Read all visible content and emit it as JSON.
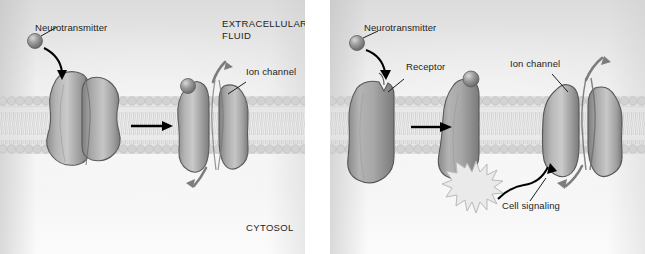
{
  "figure": {
    "panels": [
      {
        "id": "direct-gating",
        "labels": {
          "neurotransmitter": "Neurotransmitter",
          "extracellular": "EXTRACELLULAR\nFLUID",
          "ion_channel": "Ion channel",
          "cytosol": "CYTOSOL"
        },
        "structures": [
          {
            "name": "closed-ion-channel",
            "state": "closed"
          },
          {
            "name": "open-ion-channel",
            "state": "open"
          }
        ]
      },
      {
        "id": "indirect-gating",
        "labels": {
          "neurotransmitter": "Neurotransmitter",
          "receptor": "Receptor",
          "ion_channel": "Ion channel",
          "cell_signaling": "Cell signaling"
        },
        "structures": [
          {
            "name": "unbound-receptor",
            "state": "unbound"
          },
          {
            "name": "bound-receptor",
            "state": "bound"
          },
          {
            "name": "open-ion-channel",
            "state": "open"
          }
        ]
      }
    ]
  },
  "colors": {
    "protein_fill": "#9a9a9a",
    "protein_light": "#cfcfcf",
    "protein_dark": "#6f6f6f",
    "outline": "#4a4a4a",
    "membrane_head": "#cfcfcf",
    "arrow_black": "#000000",
    "arrow_gray": "#7d7d7d",
    "text": "#1d1d1d",
    "background": "#ededed",
    "starburst": "#e9e9e9"
  }
}
